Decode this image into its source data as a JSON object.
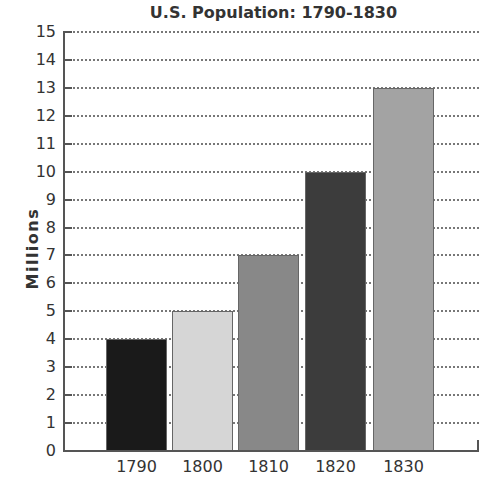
{
  "chart_data": {
    "type": "bar",
    "title": "U.S. Population: 1790-1830",
    "xlabel": "",
    "ylabel": "Millions",
    "categories": [
      "1790",
      "1800",
      "1810",
      "1820",
      "1830"
    ],
    "values": [
      4,
      5,
      7,
      10,
      13
    ],
    "colors": [
      "#1a1a1a",
      "#d6d6d6",
      "#888888",
      "#3c3c3c",
      "#a3a3a3"
    ],
    "ylim": [
      0,
      15
    ],
    "yticks": [
      "0",
      "1",
      "2",
      "3",
      "4",
      "5",
      "6",
      "7",
      "8",
      "9",
      "10",
      "11",
      "12",
      "13",
      "14",
      "15"
    ],
    "grid": true,
    "legend": null
  }
}
